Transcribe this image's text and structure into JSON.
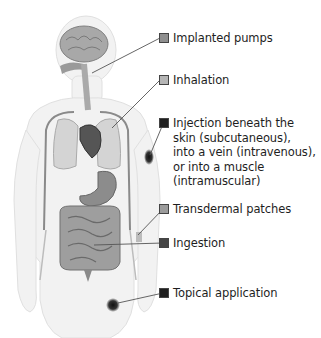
{
  "diagram": {
    "colors": {
      "swatch_light": "#9a9a9a",
      "swatch_mid": "#b7b7b7",
      "swatch_dark": "#1f1f1f",
      "swatch_darkgray": "#444444",
      "leader_line": "#555555",
      "body_fill": "#f1f1f1"
    },
    "labels": [
      {
        "id": "implanted-pumps",
        "text": "Implanted pumps",
        "swatch": "#8f8f8f"
      },
      {
        "id": "inhalation",
        "text": "Inhalation",
        "swatch": "#b5b5b5"
      },
      {
        "id": "injection",
        "text": "Injection beneath the\nskin (subcutaneous),\ninto a vein (intravenous),\nor into a muscle\n(intramuscular)",
        "swatch": "#1f1f1f"
      },
      {
        "id": "transdermal-patches",
        "text": "Transdermal patches",
        "swatch": "#9c9c9c"
      },
      {
        "id": "ingestion",
        "text": "Ingestion",
        "swatch": "#454545"
      },
      {
        "id": "topical-application",
        "text": "Topical application",
        "swatch": "#1f1f1f"
      }
    ]
  }
}
